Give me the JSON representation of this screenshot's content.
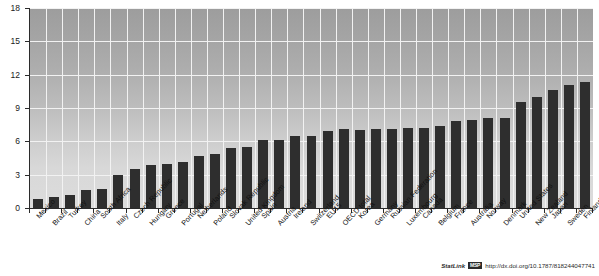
{
  "chart_data": {
    "type": "bar",
    "title": "",
    "subtitle": "",
    "xlabel": "",
    "ylabel": "",
    "ylim": [
      0,
      18
    ],
    "yticks": [
      0,
      3,
      6,
      9,
      12,
      15,
      18
    ],
    "ytick_labels": [
      "0",
      "3",
      "6",
      "9",
      "12",
      "15",
      "18"
    ],
    "grid": true,
    "legend": null,
    "legend_position": "none",
    "categories": [
      "Mexico",
      "Brazil",
      "Turkey",
      "China",
      "South Africa",
      "Italy",
      "Czech Republic",
      "Hungary",
      "Greece",
      "Portugal",
      "Netherlands",
      "Poland",
      "Slovak Republic",
      "United Kingdom",
      "Spain",
      "Austria",
      "Ireland",
      "Switzerland",
      "EU15",
      "OECD total",
      "Korea",
      "Germany",
      "Russian Federation",
      "Luxembourg",
      "Canada",
      "Belgium",
      "France",
      "Australia",
      "Norway",
      "Denmark",
      "United States",
      "New Zealand",
      "Japan",
      "Sweden",
      "Finland"
    ],
    "values": [
      0.8,
      1.0,
      1.2,
      1.6,
      1.7,
      3.0,
      3.5,
      3.9,
      4.0,
      4.1,
      4.7,
      4.9,
      5.4,
      5.5,
      6.1,
      6.1,
      6.5,
      6.5,
      6.9,
      7.1,
      7.0,
      7.1,
      7.1,
      7.2,
      7.2,
      7.4,
      7.8,
      7.9,
      8.1,
      8.1,
      9.5,
      10.0,
      10.6,
      11.1,
      11.3
    ],
    "bar_color": "#2e2e2e",
    "plot_bg_top": "#9d9d9d",
    "plot_bg_bottom": "#dcdcdc",
    "grid_color": "#f2f2f2",
    "axis_color": "#2b2b2b"
  },
  "footer": {
    "statlink_label": "StatLink",
    "statlink_badge": "MSP",
    "url": "http://dx.doi.org/10.1787/818244047741"
  }
}
